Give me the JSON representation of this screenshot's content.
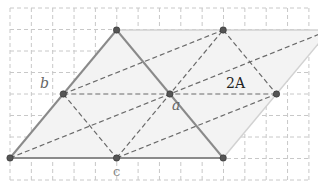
{
  "diagram": {
    "labels": {
      "b": "b",
      "a": "a",
      "c": "c",
      "area": "2A"
    },
    "points": {
      "apex": [
        2,
        0
      ],
      "top_mid": [
        4,
        0
      ],
      "top_right": [
        6,
        0
      ],
      "b": [
        1,
        1
      ],
      "a": [
        3,
        1
      ],
      "right_mid": [
        5,
        1
      ],
      "bottom_left": [
        0,
        2
      ],
      "c": [
        2,
        2
      ],
      "bottom_right": [
        4,
        2
      ]
    },
    "solid_segments": [
      [
        "bottom_left",
        "apex"
      ],
      [
        "apex",
        "bottom_right"
      ],
      [
        "bottom_left",
        "bottom_right"
      ]
    ],
    "faint_segments": [
      [
        "apex",
        "top_right"
      ],
      [
        "bottom_right",
        "top_right"
      ]
    ],
    "dashed_segments": [
      [
        "b",
        "top_mid"
      ],
      [
        "b",
        "c"
      ],
      [
        "b",
        "right_mid"
      ],
      [
        "bottom_left",
        "top_right"
      ],
      [
        "c",
        "top_mid"
      ],
      [
        "c",
        "right_mid"
      ],
      [
        "top_mid",
        "right_mid"
      ]
    ],
    "shaded_polygon": [
      "bottom_left",
      "apex",
      "top_right",
      "bottom_right"
    ]
  }
}
